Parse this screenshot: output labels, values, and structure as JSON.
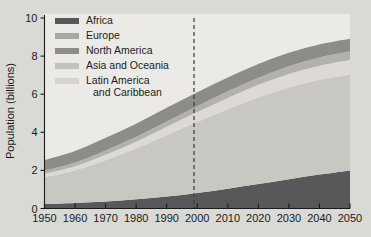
{
  "chart_data": {
    "type": "area",
    "stacked": true,
    "title": "",
    "subtitle": "",
    "xlabel": "",
    "ylabel": "Population (billions)",
    "xlim": [
      1950,
      2050
    ],
    "ylim": [
      0,
      10
    ],
    "yticks": [
      0,
      2,
      4,
      6,
      8,
      10
    ],
    "ytick_labels": [
      "0",
      "2",
      "4",
      "6",
      "8",
      "10"
    ],
    "xticks": [
      1950,
      1960,
      1970,
      1980,
      1990,
      2000,
      2010,
      2020,
      2030,
      2040,
      2050
    ],
    "xtick_labels": [
      "1950",
      "1960",
      "1970",
      "1980",
      "1990",
      "2000",
      "2010",
      "2020",
      "2030",
      "2040",
      "2050"
    ],
    "grid": false,
    "legend_position": "top-left",
    "x": [
      1950,
      1960,
      1970,
      1980,
      1990,
      2000,
      2010,
      2020,
      2030,
      2040,
      2050
    ],
    "series": [
      {
        "name": "Africa",
        "color": "#58585a",
        "values": [
          0.23,
          0.29,
          0.37,
          0.48,
          0.63,
          0.82,
          1.04,
          1.28,
          1.53,
          1.78,
          2.0
        ]
      },
      {
        "name": "Asia and Oceania",
        "color": "#c9c7c2",
        "values": [
          1.42,
          1.71,
          2.16,
          2.67,
          3.22,
          3.72,
          4.17,
          4.55,
          4.82,
          4.98,
          5.04
        ]
      },
      {
        "name": "Latin America and Caribbean",
        "color": "#ddd9d4",
        "values": [
          0.17,
          0.22,
          0.29,
          0.36,
          0.44,
          0.52,
          0.59,
          0.66,
          0.71,
          0.74,
          0.76
        ]
      },
      {
        "name": "North America",
        "color": "#b3b1ab",
        "values": [
          0.17,
          0.2,
          0.23,
          0.25,
          0.28,
          0.31,
          0.35,
          0.38,
          0.41,
          0.43,
          0.45
        ]
      },
      {
        "name": "Europe",
        "color": "#8e8c86",
        "values": [
          0.55,
          0.6,
          0.66,
          0.69,
          0.72,
          0.73,
          0.73,
          0.72,
          0.7,
          0.68,
          0.66
        ]
      }
    ],
    "stack_order": [
      "Africa",
      "Asia and Oceania",
      "Latin America and Caribbean",
      "North America",
      "Europe"
    ],
    "annotations": [
      {
        "name": "projection-divider",
        "type": "vline",
        "x": 1999,
        "style": "dashed",
        "label": ""
      }
    ],
    "totals": [
      2.54,
      3.02,
      3.71,
      4.45,
      5.29,
      6.1,
      6.88,
      7.59,
      8.17,
      8.61,
      8.91
    ]
  },
  "legend": {
    "items": [
      {
        "label": "Africa",
        "color": "#58585a"
      },
      {
        "label": "Europe",
        "color": "#a9a7a1"
      },
      {
        "label": "North America",
        "color": "#8e8c86"
      },
      {
        "label": "Asia and Oceania",
        "color": "#c3c1bc"
      },
      {
        "label": "Latin America",
        "label2": "and Caribbean",
        "color": "#d7d4cf"
      }
    ]
  },
  "axes": {
    "y_title": "Population (billions)",
    "y_ticks": [
      "10",
      "8",
      "6",
      "4",
      "2",
      "0"
    ],
    "x_ticks": [
      "1950",
      "1960",
      "1970",
      "1980",
      "1990",
      "2000",
      "2010",
      "2020",
      "2030",
      "2040",
      "2050"
    ]
  },
  "colors": {
    "background": "#d9d9d6",
    "plot_background": "#eceae6",
    "axis": "#1b1b1b",
    "projection_line": "#3a3a3a"
  }
}
